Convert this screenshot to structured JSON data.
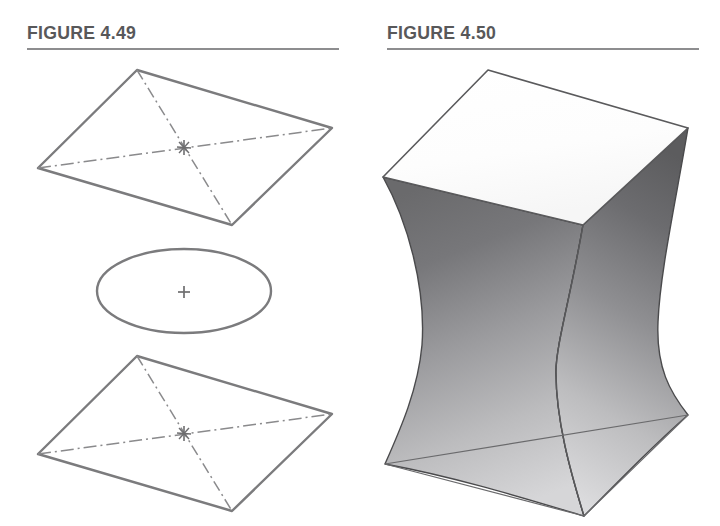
{
  "page": {
    "background": "#ffffff",
    "width": 720,
    "height": 526
  },
  "figures": [
    {
      "id": "figure-4-49",
      "title": "FIGURE 4.49",
      "rule_color": "#8d8d8f",
      "title_color": "#58585a",
      "caption": "",
      "line_color": "#7b7b7d",
      "dash_color": "#8a8a8c",
      "objects": [
        {
          "name": "top-parallelogram",
          "type": "quadrilateral",
          "vertices": [
            [
              137,
              70
            ],
            [
              332,
              128
            ],
            [
              232,
              225
            ],
            [
              38,
              168
            ]
          ],
          "diagonals": [
            [
              [
                137,
                70
              ],
              [
                232,
                225
              ]
            ],
            [
              [
                38,
                168
              ],
              [
                332,
                128
              ]
            ]
          ],
          "center_marker": {
            "type": "asterisk",
            "x": 184,
            "y": 147
          }
        },
        {
          "name": "mid-ellipse",
          "type": "ellipse",
          "cx": 184,
          "cy": 291,
          "rx": 87,
          "ry": 42,
          "center_marker": {
            "type": "plus",
            "x": 184,
            "y": 292
          }
        },
        {
          "name": "bottom-parallelogram",
          "type": "quadrilateral",
          "vertices": [
            [
              137,
              356
            ],
            [
              332,
              414
            ],
            [
              232,
              511
            ],
            [
              38,
              454
            ]
          ],
          "diagonals": [
            [
              [
                137,
                356
              ],
              [
                232,
                511
              ]
            ],
            [
              [
                38,
                454
              ],
              [
                332,
                414
              ]
            ]
          ],
          "center_marker": {
            "type": "asterisk",
            "x": 184,
            "y": 433
          }
        }
      ]
    },
    {
      "id": "figure-4-50",
      "title": "FIGURE 4.50",
      "rule_color": "#8d8d8f",
      "title_color": "#58585a",
      "caption": "",
      "line_color": "#58585a",
      "objects": [
        {
          "name": "hyperboloid-solid",
          "type": "ruled-surface-solid",
          "top_face": {
            "name": "top-face",
            "fill": "#fefefe",
            "vertices": [
              [
                128,
                70
              ],
              [
                328,
                128
              ],
              [
                223,
                225
              ],
              [
                23,
                177
              ]
            ]
          },
          "base_face": {
            "name": "base-face",
            "vertices": [
              [
                25,
                464
              ],
              [
                328,
                415
              ],
              [
                224,
                516
              ]
            ]
          },
          "left_panel": {
            "name": "left-shaded-panel",
            "fill_top": "#6e6e70",
            "fill_bottom": "#c9c9cb"
          },
          "right_panel": {
            "name": "right-shaded-panel",
            "fill_top": "#5f5f61",
            "fill_bottom": "#d2d2d4"
          },
          "waist_y": 312
        }
      ]
    }
  ]
}
